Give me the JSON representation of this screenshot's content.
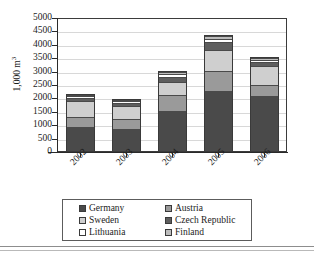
{
  "chart_data": {
    "type": "bar",
    "subtype": "stacked-column",
    "title": "",
    "xlabel": "",
    "ylabel": "1,000 m³",
    "ylabel_parts": {
      "base": "1,000 m",
      "sup": "3"
    },
    "categories": [
      "2002",
      "2003",
      "2004",
      "2005",
      "2006"
    ],
    "ylim": [
      0,
      5000
    ],
    "ytick_step": 500,
    "yticks": [
      0,
      500,
      1000,
      1500,
      2000,
      2500,
      3000,
      3500,
      4000,
      4500,
      5000
    ],
    "ytick_labels": [
      "0",
      "500",
      "1000",
      "1500",
      "2000",
      "2500",
      "3000",
      "3500",
      "4000",
      "4500",
      "5000"
    ],
    "grid": true,
    "grid_axis": "y",
    "legend_position": "bottom",
    "legend_columns": 2,
    "series": [
      {
        "name": "Germany",
        "color": "#4a4a4a",
        "values": [
          950,
          850,
          1520,
          2280,
          2110
        ]
      },
      {
        "name": "Austria",
        "color": "#9a9a9a",
        "values": [
          370,
          400,
          630,
          760,
          390
        ]
      },
      {
        "name": "Sweden",
        "color": "#cfcfcf",
        "values": [
          620,
          480,
          510,
          800,
          740
        ]
      },
      {
        "name": "Czech Republic",
        "color": "#5e5e5e",
        "values": [
          110,
          130,
          180,
          290,
          160
        ]
      },
      {
        "name": "Lithuania",
        "color": "#ffffff",
        "values": [
          60,
          70,
          90,
          130,
          70
        ]
      },
      {
        "name": "Finland",
        "color": "#bdbdbd",
        "values": [
          40,
          50,
          80,
          100,
          60
        ]
      }
    ],
    "totals": [
      2150,
      1980,
      3010,
      4360,
      3530
    ]
  },
  "legend": {
    "items": [
      {
        "label": "Germany",
        "color": "#4a4a4a"
      },
      {
        "label": "Austria",
        "color": "#9a9a9a"
      },
      {
        "label": "Sweden",
        "color": "#cfcfcf"
      },
      {
        "label": "Czech Republic",
        "color": "#5e5e5e"
      },
      {
        "label": "Lithuania",
        "color": "#ffffff"
      },
      {
        "label": "Finland",
        "color": "#bdbdbd"
      }
    ]
  }
}
